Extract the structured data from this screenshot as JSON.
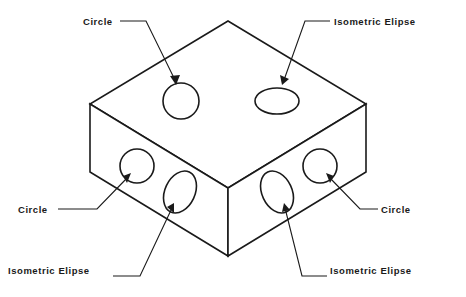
{
  "figure": {
    "type": "isometric-technical-drawing",
    "background_color": "#ffffff",
    "line_color": "#1a1a1a"
  },
  "callouts": [
    {
      "id": "circle-top-left",
      "label": "Circle",
      "align": "right",
      "describes": "true circle on the top face (left hole)"
    },
    {
      "id": "ellipse-top-right",
      "label": "Isometric Elipse",
      "align": "left",
      "describes": "isometric ellipse on the top face (right hole)"
    },
    {
      "id": "circle-mid-left",
      "label": "Circle",
      "align": "right",
      "describes": "true circle on the left front face (upper hole)"
    },
    {
      "id": "circle-mid-right",
      "label": "Circle",
      "align": "left",
      "describes": "true circle on the right front face (upper hole)"
    },
    {
      "id": "ellipse-bottom-left",
      "label": "Isometric Elipse",
      "align": "right",
      "describes": "isometric ellipse on the left front face (lower hole)"
    },
    {
      "id": "ellipse-bottom-right",
      "label": "Isometric Elipse",
      "align": "left",
      "describes": "isometric ellipse on the right front face (lower hole)"
    }
  ],
  "geometry": {
    "block": {
      "top_apex": [
        228,
        21
      ],
      "left_corner": [
        90,
        104
      ],
      "right_corner": [
        366,
        104
      ],
      "front_vertex_top": [
        228,
        188
      ],
      "front_vertex_bottom": [
        228,
        256
      ],
      "left_bottom": [
        90,
        172
      ],
      "right_bottom": [
        366,
        172
      ]
    },
    "holes": [
      {
        "face": "top",
        "shape": "circle",
        "cx": 181,
        "cy": 101,
        "r": 18
      },
      {
        "face": "top",
        "shape": "ellipse",
        "cx": 277,
        "cy": 101,
        "rx": 22,
        "ry": 13,
        "rotation": 0
      },
      {
        "face": "left",
        "shape": "circle",
        "cx": 137,
        "cy": 166,
        "r": 17
      },
      {
        "face": "left",
        "shape": "ellipse",
        "cx": 180,
        "cy": 192,
        "rx": 15,
        "ry": 22,
        "rotation": 25
      },
      {
        "face": "right",
        "shape": "ellipse",
        "cx": 277,
        "cy": 192,
        "rx": 15,
        "ry": 22,
        "rotation": -25
      },
      {
        "face": "right",
        "shape": "circle",
        "cx": 320,
        "cy": 166,
        "r": 17
      }
    ]
  }
}
